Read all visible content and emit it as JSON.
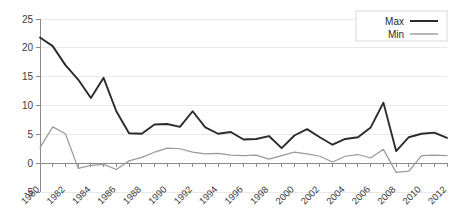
{
  "chart_data": {
    "type": "line",
    "title": "",
    "xlabel": "",
    "ylabel": "",
    "xlim": [
      1980,
      2012
    ],
    "ylim": [
      -5,
      25
    ],
    "yticks": [
      -5,
      0,
      5,
      10,
      15,
      20,
      25
    ],
    "ytick_labels": [
      "-5",
      "0",
      "5",
      "10",
      "15",
      "20",
      "25"
    ],
    "xticks": [
      1980,
      1982,
      1984,
      1986,
      1988,
      1990,
      1992,
      1994,
      1996,
      1998,
      2000,
      2002,
      2004,
      2006,
      2008,
      2010,
      2012
    ],
    "xtick_labels": [
      "1980",
      "1982",
      "1984",
      "1986",
      "1988",
      "1990",
      "1992",
      "1994",
      "1996",
      "1998",
      "2000",
      "2002",
      "2004",
      "2006",
      "2008",
      "2010",
      "2012"
    ],
    "x": [
      1980,
      1981,
      1982,
      1983,
      1984,
      1985,
      1986,
      1987,
      1988,
      1989,
      1990,
      1991,
      1992,
      1993,
      1994,
      1995,
      1996,
      1997,
      1998,
      1999,
      2000,
      2001,
      2002,
      2003,
      2004,
      2005,
      2006,
      2007,
      2008,
      2009,
      2010,
      2011,
      2012
    ],
    "grid": true,
    "grid_axis": "y",
    "legend_position": "top-right",
    "series": [
      {
        "name": "Max",
        "color": "#2b2b2b",
        "values": [
          21.8,
          20.3,
          17.0,
          14.5,
          11.3,
          14.8,
          9.0,
          5.2,
          5.1,
          6.7,
          6.8,
          6.3,
          9.0,
          6.2,
          5.1,
          5.4,
          4.1,
          4.2,
          4.7,
          2.6,
          4.8,
          5.9,
          4.5,
          3.2,
          4.2,
          4.5,
          6.2,
          10.5,
          2.1,
          4.5,
          5.1,
          5.3,
          4.4
        ]
      },
      {
        "name": "Min",
        "color": "#9a9a9a",
        "values": [
          2.7,
          6.3,
          5.1,
          -0.9,
          -0.4,
          -0.2,
          -1.1,
          0.4,
          1.0,
          1.9,
          2.6,
          2.5,
          1.9,
          1.6,
          1.7,
          1.4,
          1.3,
          1.4,
          0.7,
          1.3,
          1.9,
          1.6,
          1.2,
          0.2,
          1.2,
          1.5,
          0.9,
          2.4,
          -1.6,
          -1.4,
          1.3,
          1.4,
          1.3
        ]
      }
    ]
  },
  "legend": {
    "items": [
      {
        "label": "Max",
        "swatch": "max-line-swatch"
      },
      {
        "label": "Min",
        "swatch": "min-line-swatch"
      }
    ]
  }
}
